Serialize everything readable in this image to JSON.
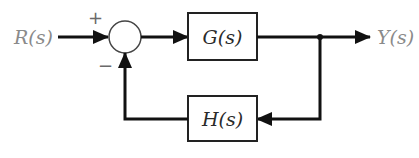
{
  "diagram": {
    "type": "feedback-control-block-diagram",
    "input": {
      "label": "R(s)"
    },
    "output": {
      "label": "Y(s)"
    },
    "summing_junction": {
      "plus_sign": "+",
      "minus_sign": "−"
    },
    "forward_block": {
      "label": "G(s)"
    },
    "feedback_block": {
      "label": "H(s)"
    },
    "colors": {
      "wire": "#111111",
      "signal_text": "#8a8a8a",
      "block_text": "#2a2a2a"
    }
  }
}
